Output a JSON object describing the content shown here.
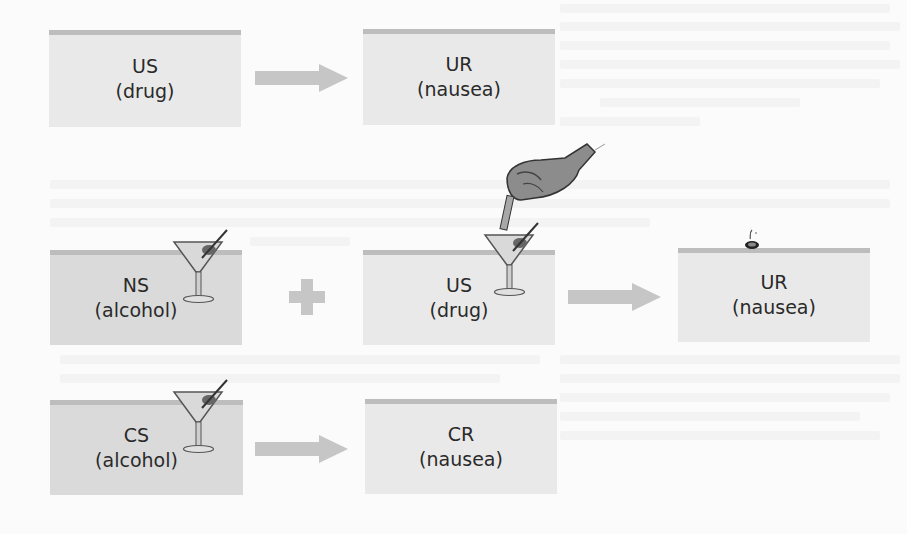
{
  "diagram": {
    "type": "classical-conditioning-taste-aversion",
    "colors": {
      "box_light": "#e9e9e9",
      "box_dark": "#dadada",
      "box_stripe": "#bdbdbd",
      "connector": "#c6c6c6",
      "text": "#2a2a2a"
    },
    "rows": [
      {
        "stage": "before",
        "stimulus": {
          "abbr": "US",
          "label": "(drug)"
        },
        "connector": "arrow",
        "response": {
          "abbr": "UR",
          "label": "(nausea)"
        }
      },
      {
        "stage": "during",
        "neutral": {
          "abbr": "NS",
          "label": "(alcohol)"
        },
        "connector_1": "plus",
        "stimulus": {
          "abbr": "US",
          "label": "(drug)"
        },
        "connector_2": "arrow",
        "response": {
          "abbr": "UR",
          "label": "(nausea)"
        }
      },
      {
        "stage": "after",
        "stimulus": {
          "abbr": "CS",
          "label": "(alcohol)"
        },
        "connector": "arrow",
        "response": {
          "abbr": "CR",
          "label": "(nausea)"
        }
      }
    ],
    "icons": [
      "martini-glass-icon",
      "hand-with-dropper-icon",
      "vomit-splash-icon"
    ]
  }
}
